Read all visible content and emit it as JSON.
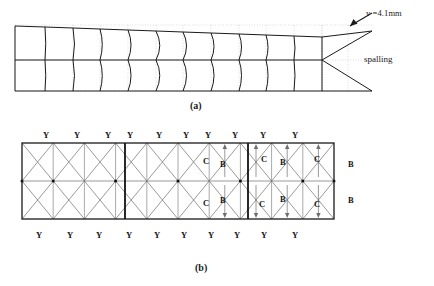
{
  "figure": {
    "panel_a": {
      "caption": "(a)",
      "annotations": {
        "displacement": "v =4.1mm",
        "spalling": "spalling"
      },
      "geometry": {
        "left": 15,
        "right": 372,
        "top": 26,
        "bottom": 91,
        "midline": 60,
        "wedge_apex_x": 322,
        "wedge_apex_y": 60,
        "top_tip_y": 31,
        "bottom_tip_y": 91,
        "column_x": [
          15,
          45,
          73,
          100,
          128,
          156,
          183,
          211,
          239,
          266,
          294,
          322
        ],
        "deformed_top_y": [
          26,
          27,
          28,
          29,
          30,
          31,
          32,
          33,
          34,
          35,
          36,
          37
        ],
        "bulge": [
          0,
          1.5,
          3,
          4.5,
          6,
          7.5,
          7,
          6,
          5,
          4,
          2,
          0
        ]
      },
      "arrow": {
        "tail_x": 372,
        "tail_y": 13,
        "head_x": 350,
        "head_y": 26
      }
    },
    "panel_b": {
      "caption": "(b)",
      "geometry": {
        "left": 22,
        "right": 334,
        "top": 143,
        "bottom": 219,
        "midline": 181,
        "cell_count_x": 10,
        "cell_count_y": 2,
        "thick_dividers_x": [
          125,
          248
        ]
      },
      "top_labels": [
        "Y",
        "Y",
        "Y",
        "Y",
        "Y",
        "Y",
        "Y",
        "Y",
        "Y",
        "Y"
      ],
      "top_labels_x": [
        43,
        74,
        105,
        127,
        156,
        183,
        205,
        232,
        260,
        292
      ],
      "top_labels_y": 131,
      "bottom_labels": [
        "Y",
        "Y",
        "Y",
        "Y",
        "Y",
        "Y",
        "Y",
        "Y",
        "Y",
        "Y"
      ],
      "bottom_labels_x": [
        36,
        67,
        96,
        126,
        154,
        181,
        208,
        234,
        261,
        292
      ],
      "bottom_labels_y": 231,
      "right_labels": [
        "B",
        "B"
      ],
      "right_labels_pos": [
        [
          348,
          160
        ],
        [
          348,
          196
        ]
      ],
      "interior_labels": [
        {
          "text": "C",
          "x": 203,
          "y": 157
        },
        {
          "text": "B",
          "x": 220,
          "y": 160
        },
        {
          "text": "C",
          "x": 261,
          "y": 155
        },
        {
          "text": "B",
          "x": 280,
          "y": 158
        },
        {
          "text": "C",
          "x": 314,
          "y": 155
        },
        {
          "text": "C",
          "x": 203,
          "y": 199
        },
        {
          "text": "B",
          "x": 220,
          "y": 196
        },
        {
          "text": "C",
          "x": 259,
          "y": 200
        },
        {
          "text": "B",
          "x": 280,
          "y": 195
        },
        {
          "text": "C",
          "x": 314,
          "y": 200
        }
      ]
    },
    "colors": {
      "line": "#1a1a1a",
      "grid": "#b9b9b9",
      "mesh": "#6e6e6e",
      "thick": "#111111",
      "background": "#ffffff"
    }
  }
}
